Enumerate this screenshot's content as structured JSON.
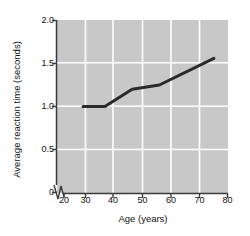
{
  "chart_data": {
    "type": "line",
    "title": "",
    "xlabel": "Age (years)",
    "ylabel": "Average reaction time (seconds)",
    "xlim": [
      20,
      80
    ],
    "ylim": [
      0,
      2.0
    ],
    "xticks": [
      20,
      30,
      40,
      50,
      60,
      70,
      80
    ],
    "xtick_labels": [
      "20",
      "30",
      "40",
      "50",
      "60",
      "70",
      "80"
    ],
    "yticks": [
      0,
      0.5,
      1.0,
      1.5,
      2.0
    ],
    "ytick_labels": [
      "0",
      "0.5",
      "1.0",
      "1.5",
      "2.0"
    ],
    "grid": true,
    "grid_color": "#ffffff",
    "plot_background": "#c8c8c8",
    "line_color": "#2a2a2a",
    "line_width": 3,
    "axis_break": true,
    "legend": null,
    "series": [
      {
        "name": "Average reaction time",
        "x": [
          27,
          35,
          45,
          55,
          75
        ],
        "values": [
          1.0,
          1.0,
          1.2,
          1.25,
          1.56
        ]
      }
    ]
  },
  "axes": {
    "x_axis_label": "Age (years)",
    "y_axis_label": "Average reaction time (seconds)"
  }
}
